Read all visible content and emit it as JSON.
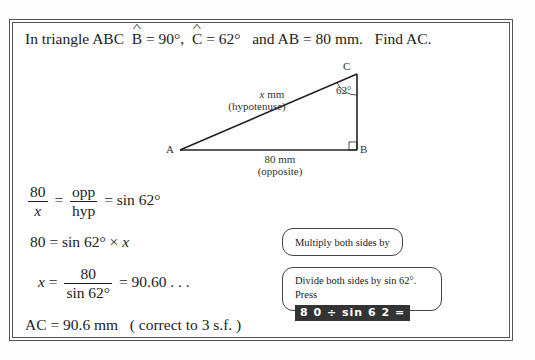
{
  "question": {
    "prefix": "In triangle ABC",
    "angle_b_letter": "B",
    "angle_b_value": " = 90°,",
    "angle_c_letter": "C",
    "angle_c_value": " = 62°",
    "mid": "and  AB = 80 mm.",
    "ask": "Find AC."
  },
  "diagram": {
    "vertex_a": "A",
    "vertex_b": "B",
    "vertex_c": "C",
    "angle_c": "62°",
    "hyp_var": "x",
    "hyp_unit": " mm",
    "hyp_label": "(hypotenuse)",
    "base_length": "80 mm",
    "base_label": "(opposite)"
  },
  "steps": {
    "s1": {
      "num1": "80",
      "den1": "x",
      "eq1": "=",
      "num2": "opp",
      "den2": "hyp",
      "eq2": "=",
      "rhs": "sin 62°"
    },
    "s2": {
      "lhs": "80 =",
      "rhs": "sin 62° ×",
      "var": "x"
    },
    "s3": {
      "var": "x",
      "eq": "=",
      "num": "80",
      "den": "sin 62°",
      "rhs": "= 90.60 . . ."
    },
    "s4": {
      "text": "AC = 90.6 mm",
      "note": "( correct to 3 s.f. )"
    }
  },
  "notes": {
    "multiply_prefix": "Multiply both sides by ",
    "multiply_var": "x",
    "multiply_suffix": ".",
    "divide_text": "Divide both sides by sin 62°. Press",
    "calc_keys": "8 0 ÷ sin 6 2 ="
  }
}
